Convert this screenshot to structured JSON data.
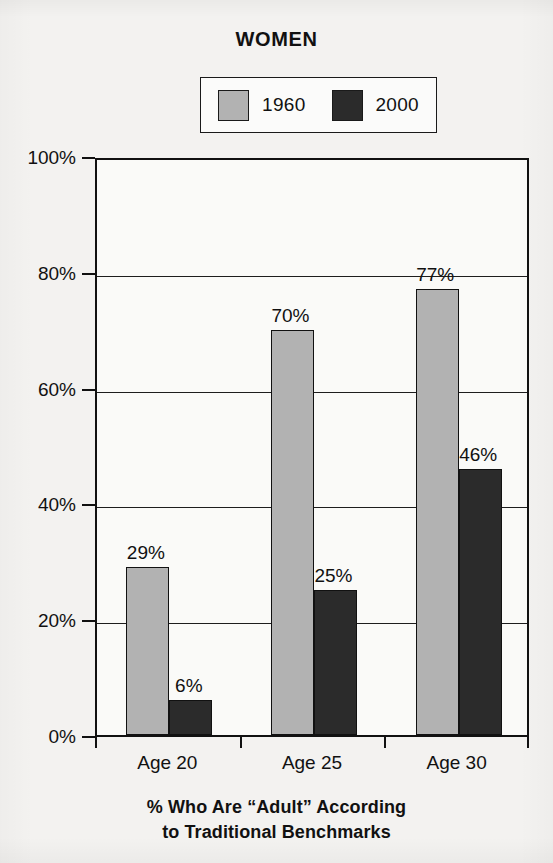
{
  "chart_data": {
    "type": "bar",
    "title": "WOMEN",
    "categories": [
      "Age 20",
      "Age 25",
      "Age 30"
    ],
    "series": [
      {
        "name": "1960",
        "color": "#b2b2b2",
        "values": [
          29,
          70,
          77
        ],
        "labels": [
          "29%",
          "70%",
          "77%"
        ]
      },
      {
        "name": "2000",
        "color": "#2b2b2b",
        "values": [
          6,
          25,
          46
        ],
        "labels": [
          "6%",
          "25%",
          "46%"
        ]
      }
    ],
    "xlabel": "",
    "ylabel": "",
    "ylim": [
      0,
      100
    ],
    "yticks": [
      0,
      20,
      40,
      60,
      80,
      100
    ],
    "ytick_labels": [
      "0%",
      "20%",
      "40%",
      "60%",
      "80%",
      "100%"
    ],
    "grid": true,
    "legend_position": "top-center",
    "caption_lines": [
      "% Who Are “Adult” According",
      "to Traditional Benchmarks"
    ]
  },
  "legend": {
    "entries": [
      {
        "label": "1960",
        "swatch": "legend-swatch-1960"
      },
      {
        "label": "2000",
        "swatch": "legend-swatch-2000"
      }
    ]
  },
  "colors": {
    "series_1960": "#b2b2b2",
    "series_2000": "#2b2b2b",
    "axis": "#111111",
    "background": "#f3f2f0"
  }
}
